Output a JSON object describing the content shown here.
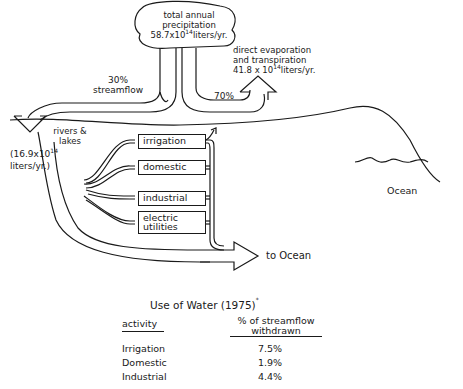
{
  "diagram": {
    "precipitation": {
      "label_line1": "total annual",
      "label_line2": "precipitation",
      "value": "58.7x10",
      "exponent": "14",
      "unit": "liters/yr."
    },
    "evaporation": {
      "label_line1": "direct evaporation",
      "label_line2": "and transpiration",
      "value": "41.8 x 10",
      "exponent": "14",
      "unit": "liters/yr.",
      "percent": "70%"
    },
    "streamflow": {
      "percent": "30%",
      "label": "streamflow"
    },
    "rivers": {
      "label_line1": "rivers &",
      "label_line2": "lakes",
      "value": "(16.9x10",
      "exponent": "14",
      "unit": "liters/yr.)"
    },
    "uses": [
      {
        "label": "irrigation"
      },
      {
        "label": "domestic"
      },
      {
        "label": "industrial"
      },
      {
        "label_line1": "electric",
        "label_line2": "utilities"
      }
    ],
    "to_ocean": "to Ocean",
    "ocean": "Ocean"
  },
  "table": {
    "title": "Use of  Water (1975)",
    "title_mark": "*",
    "headers": {
      "activity": "activity",
      "percent_line1": "% of streamflow",
      "percent_line2": "withdrawn"
    },
    "rows": [
      {
        "activity": "Irrigation",
        "percent": "7.5%"
      },
      {
        "activity": "Domestic",
        "percent": "1.9%"
      },
      {
        "activity": "Industrial",
        "percent": "4.4%"
      }
    ]
  }
}
